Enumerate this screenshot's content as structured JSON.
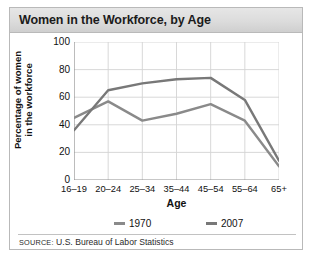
{
  "card": {
    "title": "Women in the Workforce, by Age",
    "source_prefix": "SOURCE:",
    "source_text": " U.S. Bureau of Labor Statistics"
  },
  "chart_data": {
    "type": "line",
    "title": "Women in the Workforce, by Age",
    "xlabel": "Age",
    "ylabel_line1": "Percentage of women",
    "ylabel_line2": "in the workforce",
    "categories": [
      "16–19",
      "20–24",
      "25–34",
      "35–44",
      "45–54",
      "55–64",
      "65+"
    ],
    "yticks": [
      100,
      80,
      60,
      40,
      20,
      0
    ],
    "ylim": [
      0,
      100
    ],
    "grid": true,
    "legend_position": "bottom",
    "series": [
      {
        "name": "1970",
        "color": "#8a8a8a",
        "values": [
          45,
          57,
          43,
          48,
          55,
          43,
          10
        ]
      },
      {
        "name": "2007",
        "color": "#787878",
        "values": [
          36,
          65,
          70,
          73,
          74,
          58,
          14
        ]
      }
    ]
  }
}
